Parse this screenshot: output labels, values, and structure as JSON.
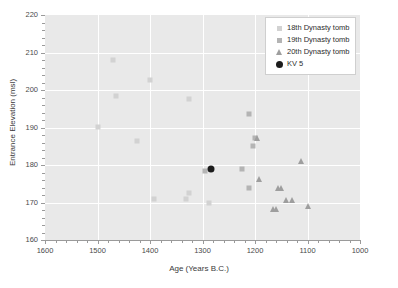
{
  "chart_data": {
    "type": "scatter",
    "title": "",
    "xlabel": "Age (Years B.C.)",
    "ylabel": "Entrance Elevation (msl)",
    "xlim": [
      1600,
      1000
    ],
    "ylim": [
      160,
      220
    ],
    "x_reversed": true,
    "xticks": [
      1600,
      1500,
      1400,
      1300,
      1200,
      1100,
      1000
    ],
    "yticks": [
      160,
      170,
      180,
      190,
      200,
      210,
      220
    ],
    "xtick_labels": [
      "1600",
      "1500",
      "1400",
      "1300",
      "1200",
      "1100",
      "1000"
    ],
    "ytick_labels": [
      "160",
      "170",
      "180",
      "190",
      "200",
      "210",
      "220"
    ],
    "grid": true,
    "grid_color": "#ffffff",
    "panel_background": "#e9e9e9",
    "legend_position": "top-right",
    "series": [
      {
        "name": "18th Dynasty tomb",
        "marker": "square",
        "color": "#d2d2d2",
        "points": [
          {
            "x": 1500,
            "y": 190.2
          },
          {
            "x": 1470,
            "y": 208.0
          },
          {
            "x": 1465,
            "y": 198.3
          },
          {
            "x": 1425,
            "y": 186.4
          },
          {
            "x": 1400,
            "y": 202.8
          },
          {
            "x": 1392,
            "y": 170.9
          },
          {
            "x": 1325,
            "y": 197.5
          },
          {
            "x": 1332,
            "y": 170.9
          },
          {
            "x": 1325,
            "y": 172.5
          },
          {
            "x": 1288,
            "y": 169.9
          }
        ]
      },
      {
        "name": "19th Dynasty tomb",
        "marker": "square",
        "color": "#b4b4b4",
        "points": [
          {
            "x": 1295,
            "y": 178.3
          },
          {
            "x": 1225,
            "y": 178.9
          },
          {
            "x": 1212,
            "y": 193.5
          },
          {
            "x": 1211,
            "y": 174.0
          },
          {
            "x": 1203,
            "y": 185.2
          },
          {
            "x": 1200,
            "y": 187.2
          }
        ]
      },
      {
        "name": "20th Dynasty tomb",
        "marker": "triangle",
        "color": "#9e9e9e",
        "points": [
          {
            "x": 1197,
            "y": 187.2
          },
          {
            "x": 1192,
            "y": 176.2
          },
          {
            "x": 1165,
            "y": 168.2
          },
          {
            "x": 1161,
            "y": 168.2
          },
          {
            "x": 1157,
            "y": 174.0
          },
          {
            "x": 1151,
            "y": 174.0
          },
          {
            "x": 1141,
            "y": 170.7
          },
          {
            "x": 1130,
            "y": 170.7
          },
          {
            "x": 1113,
            "y": 181.0
          },
          {
            "x": 1100,
            "y": 169.2
          }
        ]
      },
      {
        "name": "KV 5",
        "marker": "circle",
        "color": "#1c1c1c",
        "points": [
          {
            "x": 1284,
            "y": 178.9
          }
        ]
      }
    ]
  },
  "legend": {
    "items": [
      {
        "label": "18th Dynasty tomb",
        "marker": "square-light"
      },
      {
        "label": "19th Dynasty tomb",
        "marker": "square-mid"
      },
      {
        "label": "20th Dynasty tomb",
        "marker": "triangle"
      },
      {
        "label": "KV 5",
        "marker": "circle-black"
      }
    ]
  }
}
